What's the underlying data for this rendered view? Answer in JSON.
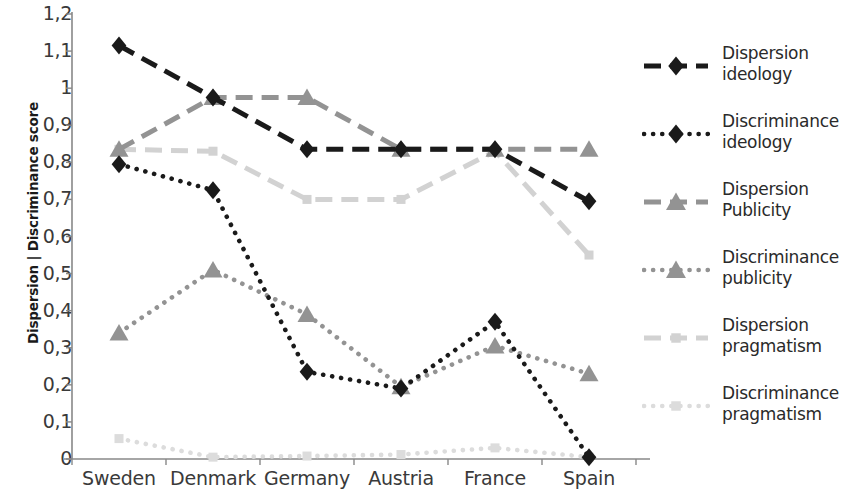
{
  "chart_data": {
    "type": "line",
    "title": "",
    "xlabel": "",
    "ylabel": "Dispersion | Discriminance score",
    "categories": [
      "Sweden",
      "Denmark",
      "Germany",
      "Austria",
      "France",
      "Spain"
    ],
    "ylim": [
      0,
      1.2
    ],
    "yticks": [
      "0",
      "0,1",
      "0,2",
      "0,3",
      "0,4",
      "0,5",
      "0,6",
      "0,7",
      "0,8",
      "0,9",
      "1",
      "1,1",
      "1,2"
    ],
    "ytick_values": [
      0,
      0.1,
      0.2,
      0.3,
      0.4,
      0.5,
      0.6,
      0.7,
      0.8,
      0.9,
      1.0,
      1.1,
      1.2
    ],
    "grid": false,
    "legend_position": "right",
    "decimal_separator": ",",
    "series": [
      {
        "name": "Dispersion ideology",
        "values": [
          1.115,
          0.975,
          0.835,
          0.835,
          0.835,
          0.695
        ],
        "color": "#1a1a1a",
        "style": "dashed",
        "marker": "diamond"
      },
      {
        "name": "Discriminance ideology",
        "values": [
          0.795,
          0.725,
          0.235,
          0.19,
          0.37,
          0.005
        ],
        "color": "#1a1a1a",
        "style": "dotted",
        "marker": "diamond"
      },
      {
        "name": "Dispersion Publicity",
        "values": [
          0.835,
          0.975,
          0.975,
          0.835,
          0.835,
          0.835
        ],
        "color": "#939393",
        "style": "dashed",
        "marker": "triangle"
      },
      {
        "name": "Discriminance publicity",
        "values": [
          0.34,
          0.51,
          0.39,
          0.195,
          0.305,
          0.23
        ],
        "color": "#939393",
        "style": "dotted",
        "marker": "triangle"
      },
      {
        "name": "Dispersion pragmatism",
        "values": [
          0.835,
          0.83,
          0.7,
          0.7,
          0.83,
          0.55
        ],
        "color": "#d2d2d2",
        "style": "dashed",
        "marker": "square"
      },
      {
        "name": "Discriminance pragmatism",
        "values": [
          0.055,
          0.005,
          0.008,
          0.012,
          0.03,
          0.005
        ],
        "color": "#dcdcdc",
        "style": "dotted",
        "marker": "square"
      }
    ]
  },
  "axes": {
    "axis_color": "#888888"
  }
}
